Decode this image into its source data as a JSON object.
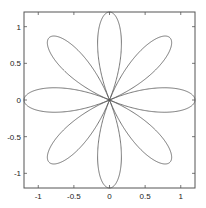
{
  "chart_data": {
    "type": "line",
    "title": "",
    "xlabel": "",
    "ylabel": "",
    "curve": {
      "function": "r = R*cos(k*theta)",
      "R": 1.2,
      "k": 4,
      "theta_range": [
        0,
        6.283185
      ]
    },
    "xlim": [
      -1.2,
      1.2
    ],
    "ylim": [
      -1.2,
      1.2
    ],
    "xticks": [
      -1,
      -0.5,
      0,
      0.5,
      1
    ],
    "xtick_labels": [
      "-1",
      "-0.5",
      "0",
      "0.5",
      "1"
    ],
    "yticks": [
      -1,
      -0.5,
      0,
      0.5,
      1
    ],
    "ytick_labels": [
      "-1",
      "-0.5",
      "0",
      "0.5",
      "1"
    ],
    "grid": false,
    "legend": null,
    "line_color": "#555555",
    "axis_color": "#555555"
  }
}
